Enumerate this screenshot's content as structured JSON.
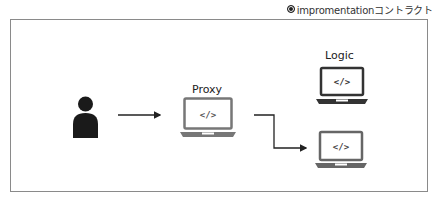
{
  "caption": {
    "text": "impromentationコントラクト"
  },
  "diagram": {
    "nodes": [
      {
        "id": "user",
        "icon": "person-icon"
      },
      {
        "id": "proxy",
        "label": "Proxy",
        "icon": "laptop-code-icon"
      },
      {
        "id": "logic",
        "label": "Logic",
        "icon": "laptop-code-icon"
      },
      {
        "id": "logic-new",
        "label": "",
        "icon": "laptop-code-icon"
      }
    ],
    "edges": [
      {
        "from": "user",
        "to": "proxy"
      },
      {
        "from": "proxy",
        "to": "logic-new"
      }
    ],
    "code_glyph": "</>"
  },
  "colors": {
    "frame": "#8a8a8a",
    "dark": "#333333",
    "gray": "#666666",
    "person": "#1a1a1a"
  }
}
